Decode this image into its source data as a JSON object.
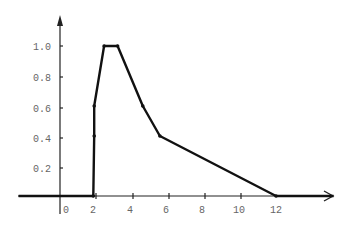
{
  "chart_data": {
    "type": "line",
    "title": "",
    "xlabel": "",
    "ylabel": "",
    "x_ticks": [
      "0",
      "2",
      "4",
      "6",
      "8",
      "10",
      "12"
    ],
    "y_ticks": [
      "0.2",
      "0.4",
      "0.6",
      "0.8",
      "1.0"
    ],
    "xlim": [
      -2.3,
      15.2
    ],
    "ylim": [
      0,
      1.1
    ],
    "grid": false,
    "legend": null,
    "series": [
      {
        "name": "piecewise linear function",
        "points": [
          [
            -2.3,
            0
          ],
          [
            1.85,
            0
          ],
          [
            1.9,
            0.4
          ],
          [
            1.9,
            0.6
          ],
          [
            2.45,
            1.0
          ],
          [
            3.2,
            1.0
          ],
          [
            4.6,
            0.6
          ],
          [
            5.55,
            0.4
          ],
          [
            12,
            0
          ],
          [
            15.2,
            0
          ]
        ],
        "markers": [
          [
            1.85,
            0
          ],
          [
            1.9,
            0.4
          ],
          [
            1.9,
            0.6
          ],
          [
            2.45,
            1.0
          ],
          [
            3.2,
            1.0
          ],
          [
            4.6,
            0.6
          ],
          [
            5.55,
            0.4
          ],
          [
            12,
            0
          ]
        ]
      }
    ]
  },
  "colors": {
    "line": "#111111",
    "axis": "#222222",
    "label": "#666666",
    "background": "#ffffff"
  }
}
